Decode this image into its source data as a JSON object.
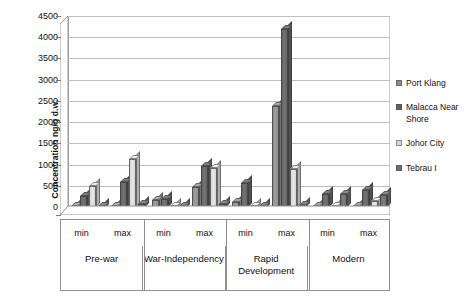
{
  "chart_data": {
    "type": "bar",
    "title": "",
    "subtitle": "",
    "xlabel": "",
    "ylabel": "Concentration ng/g d.w.",
    "ylim": [
      0,
      4500
    ],
    "ytick_step": 500,
    "yticks": [
      "4500",
      "4000",
      "3500",
      "3000",
      "2500",
      "2000",
      "1500",
      "1000",
      "500",
      "0"
    ],
    "grid": true,
    "legend_position": "right",
    "style": "3d-clustered-column",
    "group_labels": [
      "Pre-war",
      "War-Independency",
      "Rapid Development",
      "Modern"
    ],
    "sub_labels": [
      "min",
      "max"
    ],
    "categories": [
      "Pre-war min",
      "Pre-war max",
      "War-Independency min",
      "War-Independency max",
      "Rapid Development min",
      "Rapid Development max",
      "Modern min",
      "Modern max"
    ],
    "series": [
      {
        "name": "Port Klang",
        "color": "#8d8d8d",
        "values": [
          20,
          30,
          170,
          480,
          110,
          2380,
          25,
          25
        ]
      },
      {
        "name": "Malacca Near Shore",
        "color": "#636363",
        "values": [
          260,
          600,
          180,
          960,
          570,
          4200,
          300,
          400
        ]
      },
      {
        "name": "Johor City",
        "color": "#d5d5d5",
        "values": [
          500,
          1130,
          30,
          930,
          20,
          890,
          30,
          130
        ]
      },
      {
        "name": "Tebrau I",
        "color": "#6e6e6e",
        "values": [
          30,
          60,
          15,
          65,
          10,
          55,
          310,
          290
        ]
      }
    ]
  },
  "legend": {
    "items": [
      {
        "label": "Port Klang"
      },
      {
        "label": "Malacca Near Shore"
      },
      {
        "label": "Johor City"
      },
      {
        "label": "Tebrau I"
      }
    ]
  },
  "axis": {
    "y_title": "Concentration ng/g d.w."
  }
}
